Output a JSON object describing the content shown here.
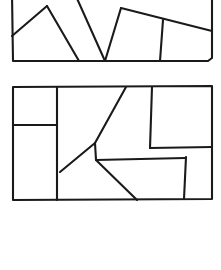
{
  "document": {
    "title": "Polygon Partition Figure",
    "background_color": "#ffffff",
    "ink_color": "#1a1a1a",
    "stroke_width": 2.1,
    "width": 221,
    "height": 270
  },
  "figures": [
    {
      "id": "upper-figure",
      "name": "upper-dissected-quadrilateral",
      "note": "cropped by top edge of image",
      "outline": "M 12,-6 L 212,-8 L 212,58 L 208,61 L 13,61 Z",
      "cuts": [
        {
          "id": "upper-cut-1",
          "name": "left-rising-diagonal",
          "d": "M 12,36 L 47,6"
        },
        {
          "id": "upper-cut-2",
          "name": "left-v-right-arm",
          "d": "M 47,6 L 79,61"
        },
        {
          "id": "upper-cut-3",
          "name": "center-v-left-arm",
          "d": "M 75,-6 L 105,61"
        },
        {
          "id": "upper-cut-4",
          "name": "center-v-right-arm",
          "d": "M 105,61 L 121,8"
        },
        {
          "id": "upper-cut-5",
          "name": "upper-right-slant",
          "d": "M 121,8 L 212,31"
        },
        {
          "id": "upper-cut-6",
          "name": "right-vertical-divider",
          "d": "M 163,20 L 160,61"
        }
      ]
    },
    {
      "id": "lower-figure",
      "name": "lower-dissected-rectangle",
      "outline": "M 13,87 L 212,86 L 212,199 L 13,200 Z",
      "cuts": [
        {
          "id": "lower-cut-1",
          "name": "left-column-vertical",
          "d": "M 57,87 L 57,200"
        },
        {
          "id": "lower-cut-2",
          "name": "left-column-horizontal",
          "d": "M 13,125 L 57,125"
        },
        {
          "id": "lower-cut-3",
          "name": "k-lower-left-diagonal",
          "d": "M 60,172 L 95,143"
        },
        {
          "id": "lower-cut-4",
          "name": "k-upper-right-diagonal",
          "d": "M 95,143 L 126,87"
        },
        {
          "id": "lower-cut-5",
          "name": "mid-horizontal",
          "d": "M 95,143 L 96,160 L 185,158"
        },
        {
          "id": "lower-cut-6",
          "name": "k-lower-right-diagonal",
          "d": "M 96,160 L 137,200"
        },
        {
          "id": "lower-cut-7",
          "name": "top-right-vertical",
          "d": "M 152,87 L 150,148"
        },
        {
          "id": "lower-cut-8",
          "name": "right-horizontal",
          "d": "M 150,148 L 212,147"
        },
        {
          "id": "lower-cut-9",
          "name": "bottom-right-vertical",
          "d": "M 186,157 L 184,199"
        }
      ]
    }
  ]
}
